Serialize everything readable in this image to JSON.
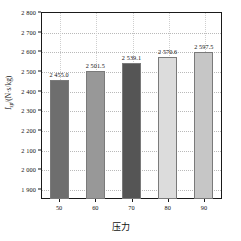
{
  "chart_data": {
    "type": "bar",
    "title": "",
    "subtitle": "",
    "xlabel": "压力",
    "ylabel": "I_sp/(N·s/kg)",
    "ylabel_parts": {
      "italic_main": "I",
      "subscript": "sp",
      "unit": "/(N·s/kg)"
    },
    "categories": [
      "50",
      "60",
      "70",
      "80",
      "90"
    ],
    "values": [
      2455.0,
      2501.5,
      2539.1,
      2570.6,
      2597.5
    ],
    "value_labels": [
      "2 455.0",
      "2 501.5",
      "2 539.1",
      "2 570.6",
      "2 597.5"
    ],
    "ylim": [
      1850,
      2800
    ],
    "yticks": [
      1900,
      2000,
      2100,
      2200,
      2300,
      2400,
      2500,
      2600,
      2700,
      2800
    ],
    "ytick_labels": [
      "1 900",
      "2 000",
      "2 100",
      "2 200",
      "2 300",
      "2 400",
      "2 500",
      "2 600",
      "2 700",
      "2 800"
    ],
    "grid": true,
    "legend": "none",
    "bar_colors": [
      "#6e6e6e",
      "#989898",
      "#555555",
      "#dcdcdc",
      "#c6c6c6"
    ],
    "bar_edge_color": "#7a7a7a",
    "axis_color": "#1a1a1a",
    "grid_color": "#b9b9b9",
    "background": "#ffffff"
  }
}
